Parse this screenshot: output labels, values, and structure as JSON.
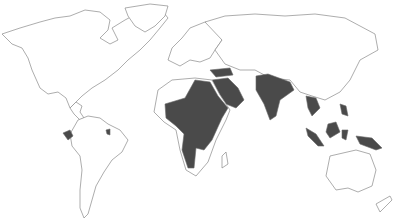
{
  "map": {
    "type": "world outline map",
    "style": "grayscale",
    "colors": {
      "background": "#ffffff",
      "outline": "#8a8a8a",
      "highlight": "#4a4a4a"
    },
    "highlighted_regions": [
      "Ecuador",
      "French Guiana",
      "West Africa",
      "Sahel",
      "Sudan",
      "Egypt",
      "Central Africa",
      "East Africa",
      "Angola",
      "Namibia",
      "Turkey",
      "Saudi Arabia",
      "Yemen",
      "Oman",
      "India",
      "Thailand",
      "Cambodia",
      "Laos",
      "Vietnam",
      "Malaysia",
      "Indonesia",
      "Philippines",
      "Papua New Guinea"
    ]
  }
}
